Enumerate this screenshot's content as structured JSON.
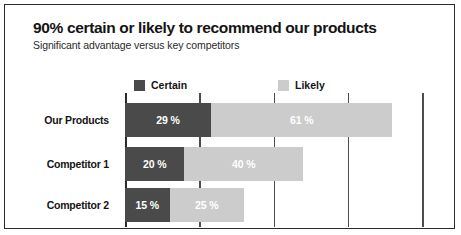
{
  "header": {
    "title": "90% certain or likely to recommend our products",
    "subtitle": "Significant advantage versus key competitors"
  },
  "colors": {
    "certain": "#4a4a4a",
    "likely": "#cccccc",
    "axis": "#2b2b2b",
    "grid": "#4d4d4d",
    "text": "#141414",
    "value_text": "#ffffff",
    "card_border": "#2b2b2b",
    "background": "#ffffff"
  },
  "legend": {
    "position": "top",
    "items": [
      {
        "label": "Certain",
        "color": "#4a4a4a",
        "swatch": "legend-swatch-certain"
      },
      {
        "label": "Likely",
        "color": "#cccccc",
        "swatch": "legend-swatch-likely"
      }
    ]
  },
  "chart_data": {
    "type": "bar",
    "orientation": "horizontal",
    "stacked": true,
    "title": "90% certain or likely to recommend our products",
    "subtitle": "Significant advantage versus key competitors",
    "xlabel": "",
    "ylabel": "",
    "categories": [
      "Our Products",
      "Competitor 1",
      "Competitor 2"
    ],
    "series": [
      {
        "name": "Certain",
        "color": "#4a4a4a",
        "values": [
          29,
          20,
          15
        ],
        "labels": [
          "29 %",
          "20 %",
          "15 %"
        ]
      },
      {
        "name": "Likely",
        "color": "#cccccc",
        "values": [
          61,
          40,
          25
        ],
        "labels": [
          "61 %",
          "40 %",
          "25 %"
        ]
      }
    ],
    "totals": [
      90,
      60,
      40
    ],
    "xlim": [
      0,
      110
    ],
    "xticks": [
      25,
      50,
      75,
      100
    ],
    "xtick_labels": [
      "",
      "",
      "",
      ""
    ],
    "grid": true,
    "grid_axis": "x",
    "legend_position": "top"
  }
}
